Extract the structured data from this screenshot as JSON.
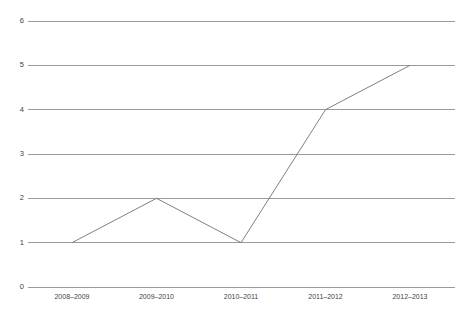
{
  "chart_data": {
    "type": "line",
    "title": "",
    "subtitle": "",
    "xlabel": "",
    "ylabel": "",
    "categories": [
      "2008–2009",
      "2009–2010",
      "2010–2011",
      "2011–2012",
      "2012–2013"
    ],
    "values": [
      1,
      2,
      1,
      4,
      5
    ],
    "series": [
      {
        "name": "",
        "values": [
          1,
          2,
          1,
          4,
          5
        ]
      }
    ],
    "ylim": [
      0,
      6
    ],
    "yticks": [
      0,
      1,
      2,
      3,
      4,
      5,
      6
    ],
    "ytick_labels": [
      "0",
      "1",
      "2",
      "3",
      "4",
      "5",
      "6"
    ],
    "grid": true,
    "grid_axis": "y",
    "legend": false,
    "legend_position": "none",
    "markers": false,
    "colors": {
      "line": "#808080",
      "gridline": "#9a9a9a",
      "tick_text": "#3f3f3f",
      "background": "#ffffff"
    },
    "annotations": []
  }
}
